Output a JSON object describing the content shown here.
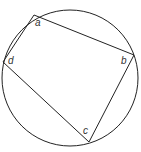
{
  "diagram": {
    "type": "cyclic-quadrilateral",
    "circle": {
      "cx": 70,
      "cy": 78,
      "r": 68
    },
    "vertices": {
      "a": {
        "label": "a",
        "x": 34,
        "y": 15
      },
      "b": {
        "label": "b",
        "x": 134,
        "y": 55
      },
      "c": {
        "label": "c",
        "x": 89,
        "y": 142
      },
      "d": {
        "label": "d",
        "x": 3,
        "y": 62
      }
    },
    "stroke_color": "#222222"
  }
}
